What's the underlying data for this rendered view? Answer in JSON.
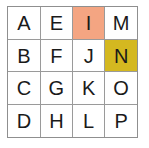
{
  "grid": {
    "rows": 4,
    "columns": 4,
    "cells": [
      [
        {
          "label": "A",
          "highlight": "none"
        },
        {
          "label": "E",
          "highlight": "none"
        },
        {
          "label": "I",
          "highlight": "peach"
        },
        {
          "label": "M",
          "highlight": "none"
        }
      ],
      [
        {
          "label": "B",
          "highlight": "none"
        },
        {
          "label": "F",
          "highlight": "none"
        },
        {
          "label": "J",
          "highlight": "none"
        },
        {
          "label": "N",
          "highlight": "gold"
        }
      ],
      [
        {
          "label": "C",
          "highlight": "none"
        },
        {
          "label": "G",
          "highlight": "none"
        },
        {
          "label": "K",
          "highlight": "none"
        },
        {
          "label": "O",
          "highlight": "none"
        }
      ],
      [
        {
          "label": "D",
          "highlight": "none"
        },
        {
          "label": "H",
          "highlight": "none"
        },
        {
          "label": "L",
          "highlight": "none"
        },
        {
          "label": "P",
          "highlight": "none"
        }
      ]
    ]
  },
  "colors": {
    "peach": "#f4a582",
    "gold": "#d4b820",
    "cell_border": "#9a9a9a",
    "outer_border": "#8f8f8f",
    "cell_background": "#ffffff",
    "text": "#1a1a1a",
    "page_background": "#ffffff"
  }
}
